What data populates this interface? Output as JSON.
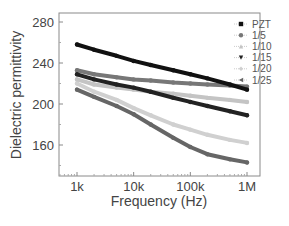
{
  "chart_data": {
    "type": "line",
    "title": "",
    "xlabel": "Frequency (Hz)",
    "ylabel": "Dielectric permittivity",
    "xscale": "log",
    "xlim": [
      600,
      2000000
    ],
    "ylim": [
      128,
      290
    ],
    "x_ticks": [
      {
        "value": 1000,
        "label": "1k"
      },
      {
        "value": 10000,
        "label": "10k"
      },
      {
        "value": 100000,
        "label": "100k"
      },
      {
        "value": 1000000,
        "label": "1M"
      }
    ],
    "y_ticks": [
      {
        "value": 160,
        "label": "160"
      },
      {
        "value": 200,
        "label": "200"
      },
      {
        "value": 240,
        "label": "240"
      },
      {
        "value": 280,
        "label": "280"
      }
    ],
    "grid": false,
    "legend_position": "top-right",
    "x": [
      1000,
      2000,
      5000,
      10000,
      20000,
      50000,
      100000,
      200000,
      500000,
      1000000
    ],
    "series": [
      {
        "name": "PZT",
        "marker": "square",
        "color": "#111111",
        "values": [
          258,
          253,
          247,
          242,
          238,
          233,
          229,
          225,
          219,
          214
        ]
      },
      {
        "name": "1/5",
        "marker": "circle",
        "color": "#777777",
        "values": [
          233,
          229,
          226,
          224,
          223,
          221,
          220,
          219,
          218,
          217
        ]
      },
      {
        "name": "1/10",
        "marker": "triangle-up",
        "color": "#c4c4c4",
        "values": [
          224,
          219,
          216,
          214,
          212,
          210,
          208,
          206,
          204,
          202
        ]
      },
      {
        "name": "1/15",
        "marker": "triangle-down",
        "color": "#222222",
        "values": [
          229,
          224,
          219,
          216,
          212,
          206,
          202,
          198,
          193,
          189
        ]
      },
      {
        "name": "1/20",
        "marker": "diamond",
        "color": "#d0d0d0",
        "values": [
          220,
          212,
          204,
          196,
          189,
          180,
          175,
          170,
          165,
          162
        ]
      },
      {
        "name": "1/25",
        "marker": "triangle-left",
        "color": "#666666",
        "values": [
          214,
          207,
          198,
          190,
          180,
          167,
          158,
          151,
          146,
          143
        ]
      }
    ]
  }
}
